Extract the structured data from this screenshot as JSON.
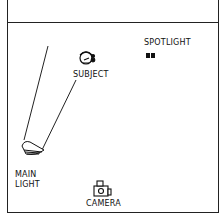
{
  "diagram": {
    "type": "lighting-setup",
    "labels": {
      "subject": "SUBJECT",
      "spotlight": "SPOTLIGHT",
      "main_light_line1": "MAIN",
      "main_light_line2": "LIGHT",
      "camera": "CAMERA"
    },
    "icons": [
      "subject-head-icon",
      "spotlight-icon",
      "main-light-icon",
      "camera-icon"
    ]
  }
}
